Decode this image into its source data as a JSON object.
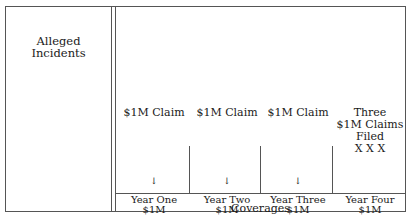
{
  "left_panel": {
    "label_line1": "Alleged",
    "label_line2": "Incidents"
  },
  "columns": [
    {
      "claim": "$1M Claim",
      "arrow": "↓",
      "year": "Year One",
      "coverage": "$1M"
    },
    {
      "claim": "$1M Claim",
      "arrow": "↓",
      "year": "Year Two",
      "coverage": "$1M"
    },
    {
      "claim": "$1M Claim",
      "arrow": "↓",
      "year": "Year Three",
      "coverage": "$1M"
    },
    {
      "claim_line1": "Three",
      "claim_line2": "$1M Claims",
      "claim_line3": "Filed",
      "marks": "X X X",
      "year": "Year Four",
      "coverage": "$1M"
    }
  ],
  "footer": {
    "label": "Coverages"
  },
  "colors": {
    "line": "#555555",
    "text": "#1a1a1a"
  }
}
